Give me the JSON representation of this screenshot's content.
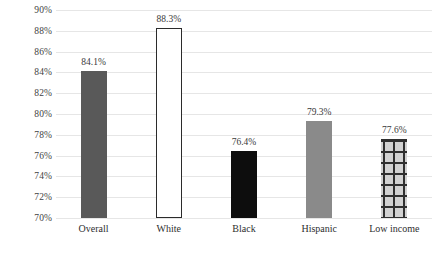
{
  "chart_data": {
    "type": "bar",
    "title": "",
    "subtitle": "",
    "xlabel": "",
    "ylabel": "",
    "ylim": [
      70,
      90
    ],
    "ytick_step": 2,
    "grid": true,
    "legend": "none",
    "categories": [
      "Overall",
      "White",
      "Black",
      "Hispanic",
      "Low income"
    ],
    "values": [
      84.1,
      76.4,
      76.4,
      79.3,
      77.6
    ],
    "series": [
      {
        "name": "Rate",
        "values": [
          84.1,
          88.3,
          76.4,
          79.3,
          77.6
        ]
      }
    ],
    "data_labels": [
      "84.1%",
      "88.3%",
      "76.4%",
      "79.3%",
      "77.6%"
    ],
    "ytick_labels": [
      "90%",
      "88%",
      "86%",
      "84%",
      "82%",
      "80%",
      "78%",
      "76%",
      "74%",
      "72%",
      "70%"
    ],
    "ytick_values": [
      90,
      88,
      86,
      84,
      82,
      80,
      78,
      76,
      74,
      72,
      70
    ],
    "bar_styles": [
      "solid-dark-gray",
      "hollow-white-outlined",
      "solid-black",
      "solid-gray",
      "grid-hatch"
    ],
    "bar_colors": [
      "#595959",
      "#ffffff",
      "#0d0d0d",
      "#8a8a8a",
      "#d2d2d2"
    ],
    "grid_color": "#e6e6e6",
    "text_color": "#3a3a3a"
  },
  "axes": {
    "y": {
      "ticks": [
        {
          "label": "90%",
          "value": 90
        },
        {
          "label": "88%",
          "value": 88
        },
        {
          "label": "86%",
          "value": 86
        },
        {
          "label": "84%",
          "value": 84
        },
        {
          "label": "82%",
          "value": 82
        },
        {
          "label": "80%",
          "value": 80
        },
        {
          "label": "78%",
          "value": 78
        },
        {
          "label": "76%",
          "value": 76
        },
        {
          "label": "74%",
          "value": 74
        },
        {
          "label": "72%",
          "value": 72
        },
        {
          "label": "70%",
          "value": 70
        }
      ]
    },
    "x": {
      "ticks": [
        {
          "label": "Overall"
        },
        {
          "label": "White"
        },
        {
          "label": "Black"
        },
        {
          "label": "Hispanic"
        },
        {
          "label": "Low income"
        }
      ]
    }
  },
  "bars": [
    {
      "category": "Overall",
      "value": 84.1,
      "label": "84.1%",
      "style": "solid-dark-gray"
    },
    {
      "category": "White",
      "value": 88.3,
      "label": "88.3%",
      "style": "hollow-white-outlined"
    },
    {
      "category": "Black",
      "value": 76.4,
      "label": "76.4%",
      "style": "solid-black"
    },
    {
      "category": "Hispanic",
      "value": 79.3,
      "label": "79.3%",
      "style": "solid-gray"
    },
    {
      "category": "Low income",
      "value": 77.6,
      "label": "77.6%",
      "style": "grid-hatch"
    }
  ]
}
